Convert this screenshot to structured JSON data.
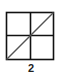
{
  "figure": {
    "label": "2",
    "shape": "square-grid-with-diagonal",
    "grid": {
      "rows": 2,
      "cols": 2
    },
    "diagonal": "bottom-left-to-top-right",
    "colors": {
      "stroke": "#111111",
      "diagonal": "#555555",
      "background": "#ffffff"
    }
  }
}
